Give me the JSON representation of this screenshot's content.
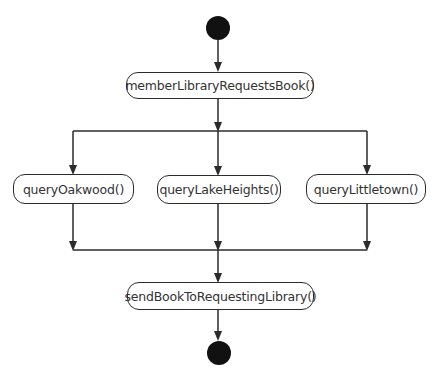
{
  "diagram": {
    "type": "UML activity diagram",
    "start_node": "initial",
    "end_node": "final",
    "actions": [
      {
        "id": "a1",
        "label": "memberLibraryRequestsBook()"
      },
      {
        "id": "a2",
        "label": "queryOakwood()"
      },
      {
        "id": "a3",
        "label": "queryLakeHeights()"
      },
      {
        "id": "a4",
        "label": "queryLittletown()"
      },
      {
        "id": "a5",
        "label": "sendBookToRequestingLibrary()"
      }
    ],
    "flows": [
      [
        "initial",
        "a1"
      ],
      [
        "a1",
        "fork"
      ],
      [
        "fork",
        "a2"
      ],
      [
        "fork",
        "a3"
      ],
      [
        "fork",
        "a4"
      ],
      [
        "a2",
        "join"
      ],
      [
        "a3",
        "join"
      ],
      [
        "a4",
        "join"
      ],
      [
        "join",
        "a5"
      ],
      [
        "a5",
        "final"
      ]
    ],
    "colors": {
      "stroke": "#2b2b2b",
      "node_fill": "#ffffff",
      "terminal_fill": "#111111"
    }
  }
}
